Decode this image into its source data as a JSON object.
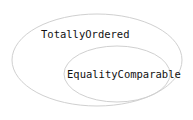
{
  "diagram": {
    "type": "euler-venn",
    "sets": [
      {
        "id": "outer",
        "label": "TotallyOrdered"
      },
      {
        "id": "inner",
        "label": "EqualityComparable"
      }
    ],
    "colors": {
      "ellipse_stroke": "#d0d0d0",
      "text": "#111111",
      "background": "#ffffff"
    }
  }
}
